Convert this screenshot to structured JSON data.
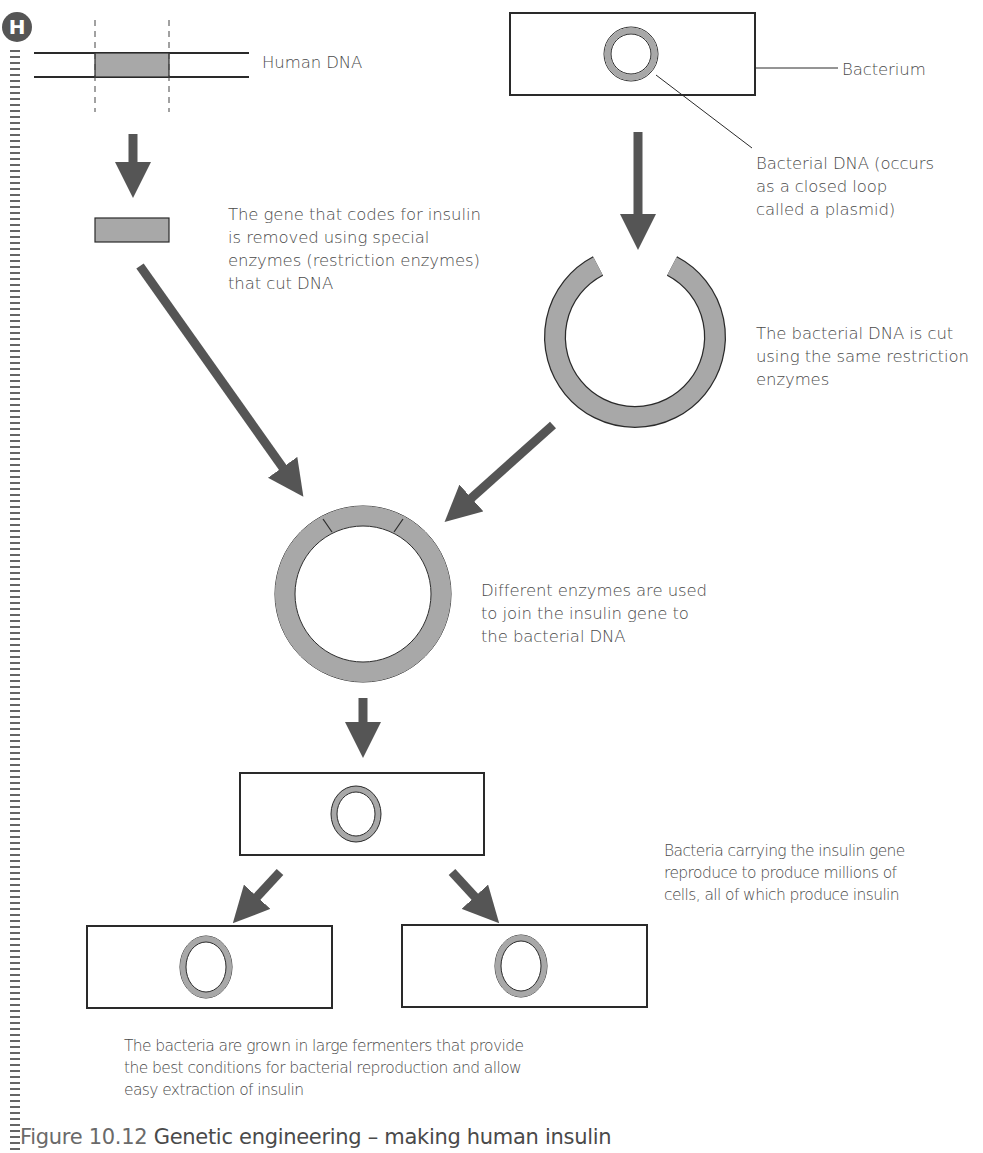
{
  "badge": {
    "letter": "H"
  },
  "labels": {
    "human_dna": "Human DNA",
    "bacterium": "Bacterium",
    "bacterial_dna": "Bacterial DNA (occurs\nas a closed loop\ncalled a plasmid)",
    "gene_removed": "The gene that codes for insulin\nis removed using special\nenzymes (restriction enzymes)\nthat cut DNA",
    "bacterial_cut": "The bacterial DNA is cut\nusing the same restriction\nenzymes",
    "join": "Different enzymes are used\nto join the insulin gene to\nthe bacterial DNA",
    "reproduce": "Bacteria carrying the insulin gene\nreproduce to produce millions of\ncells, all of which produce insulin",
    "fermenters": "The bacteria are grown in large fermenters that provide\nthe best conditions for bacterial reproduction and allow\neasy extraction of insulin"
  },
  "caption": {
    "number": "Figure 10.12",
    "title": "Genetic engineering – making human insulin"
  },
  "colors": {
    "dna_fill": "#a8a8a8",
    "arrow": "#555555",
    "outline": "#2a2a2a"
  }
}
